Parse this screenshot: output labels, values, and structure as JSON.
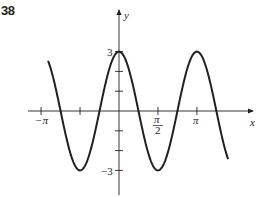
{
  "problem_number": "38",
  "chart_data": {
    "type": "line",
    "title": "",
    "function": "y = 3 cos(2x)",
    "xlabel": "x",
    "ylabel": "y",
    "x_ticks": [
      {
        "value": -3.14159,
        "label": "−π"
      },
      {
        "value": -1.5708,
        "label": ""
      },
      {
        "value": 1.5708,
        "label": "π/2"
      },
      {
        "value": 3.14159,
        "label": "π"
      }
    ],
    "y_ticks": [
      {
        "value": 3,
        "label": "3"
      },
      {
        "value": 2,
        "label": ""
      },
      {
        "value": 1,
        "label": ""
      },
      {
        "value": -1,
        "label": ""
      },
      {
        "value": -2,
        "label": ""
      },
      {
        "value": -3,
        "label": "−3"
      }
    ],
    "x_range": [
      -2.86,
      4.4
    ],
    "y_range": [
      -3,
      3
    ],
    "series": [
      {
        "name": "y = 3cos(2x)",
        "amplitude": 3,
        "frequency": 2,
        "color": "#231f20"
      }
    ],
    "grid": false,
    "legend": "none"
  },
  "labels": {
    "x_axis": "x",
    "y_axis": "y",
    "neg_pi": "−π",
    "pi": "π",
    "pi_num": "π",
    "pi_den": "2",
    "y_max": "3",
    "y_min": "−3"
  }
}
